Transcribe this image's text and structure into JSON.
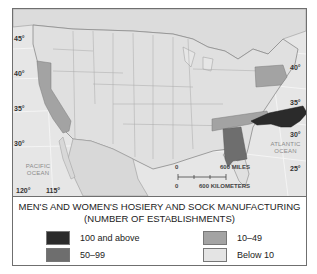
{
  "map": {
    "title": "MEN'S AND WOMEN'S HOSIERY AND SOCK MANUFACTURING",
    "subtitle": "(NUMBER OF ESTABLISHMENTS)",
    "latitude_labels_left": [
      "45°",
      "40°",
      "35°",
      "30°"
    ],
    "latitude_labels_right": [
      "40°",
      "35°",
      "30°",
      "25°"
    ],
    "longitude_labels": [
      "120°",
      "115°"
    ],
    "oceans": {
      "pacific": "PACIFIC\nOCEAN",
      "atlantic": "ATLANTIC\nOCEAN"
    },
    "scale": {
      "miles_zero": "0",
      "miles_label": "600 MILES",
      "km_zero": "0",
      "km_label": "600 KILOMETERS"
    },
    "highlighted_states": [
      {
        "state": "North Carolina",
        "category": "100 and above"
      },
      {
        "state": "Alabama",
        "category": "50-99"
      },
      {
        "state": "Tennessee",
        "category": "10-49"
      },
      {
        "state": "Pennsylvania",
        "category": "10-49"
      },
      {
        "state": "California",
        "category": "10-49"
      }
    ]
  },
  "legend": {
    "items": [
      {
        "label": "100 and above",
        "color": "#2b2b2b"
      },
      {
        "label": "50–99",
        "color": "#6e6e6e"
      },
      {
        "label": "10–49",
        "color": "#a3a3a3"
      },
      {
        "label": "Below 10",
        "color": "#e4e4e4"
      }
    ]
  },
  "colors": {
    "base": "#e4e4e4",
    "border": "#9a9a9a"
  }
}
